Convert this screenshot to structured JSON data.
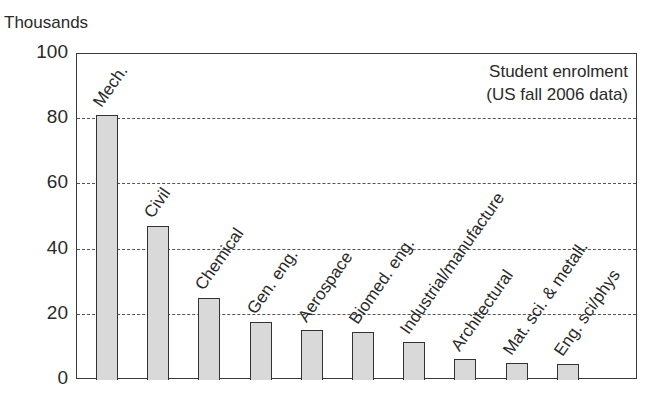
{
  "chart_data": {
    "type": "bar",
    "title": "Student enrolment (US fall 2006 data)",
    "annotation": [
      "Student enrolment",
      "(US fall 2006 data)"
    ],
    "xlabel": "",
    "ylabel": "Thousands",
    "ylim": [
      0,
      100
    ],
    "yticks": [
      0,
      20,
      40,
      60,
      80,
      100
    ],
    "grid": "horizontal dashed at 20, 40, 60, 80",
    "legend": "none",
    "categories": [
      "Mech.",
      "Civil",
      "Chemical",
      "Gen. eng.",
      "Aerospace",
      "Biomed. eng.",
      "Industrial/manufacture",
      "Architectural",
      "Mat. sci. & metall.",
      "Eng. sci/phys"
    ],
    "values": [
      81,
      47,
      25,
      17.5,
      15,
      14.5,
      11.5,
      6,
      5,
      4.5
    ],
    "bar_color": "#d9d9d9"
  }
}
